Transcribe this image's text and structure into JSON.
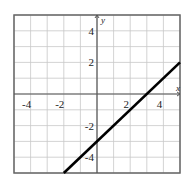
{
  "chart_data": {
    "type": "line",
    "title": "",
    "xlabel": "x",
    "ylabel": "y",
    "xlim": [
      -5,
      5
    ],
    "ylim": [
      -5,
      5
    ],
    "grid": true,
    "grid_step": 1,
    "x_tick_labels": [
      "-4",
      "-2",
      "2",
      "4"
    ],
    "x_ticks": [
      -4,
      -2,
      2,
      4
    ],
    "y_tick_labels": [
      "4",
      "2",
      "-2",
      "-4"
    ],
    "y_ticks": [
      4,
      2,
      -2,
      -4
    ],
    "series": [
      {
        "name": "y = x - 3",
        "equation": "y = x - 3",
        "x": [
          -2,
          5
        ],
        "y": [
          -5,
          2
        ],
        "color": "#000000"
      }
    ],
    "legend": "none"
  },
  "colors": {
    "grid": "#c8c8c8",
    "axis": "#555555",
    "frame": "#666666",
    "line": "#000000"
  }
}
